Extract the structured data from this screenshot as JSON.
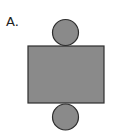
{
  "option_label": "A.",
  "diagram": {
    "type": "cylinder-net",
    "colors": {
      "fill": "#8a8a8a",
      "stroke": "#2e2e2e"
    },
    "top_circle": {
      "cx": 65.5,
      "cy": 32.5,
      "r": 13
    },
    "rectangle": {
      "x": 28,
      "y": 46,
      "width": 76,
      "height": 57
    },
    "bottom_circle": {
      "cx": 65.5,
      "cy": 117,
      "r": 13
    }
  }
}
